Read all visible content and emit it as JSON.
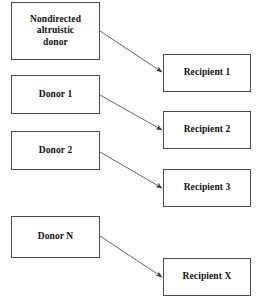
{
  "diagram": {
    "type": "flow-diagram",
    "canvas": {
      "width": 262,
      "height": 307,
      "background": "#fdfdfd"
    },
    "style": {
      "box_fill": "#ffffff",
      "box_border": "#4a4a4a",
      "text_color": "#101010",
      "arrow_color": "#555555"
    },
    "donors": [
      {
        "id": "nondirected-altruistic-donor",
        "label": "Nondirected\naltruistic\ndonor",
        "x": 11,
        "y": 2,
        "w": 89,
        "h": 58
      },
      {
        "id": "donor-1",
        "label": "Donor 1",
        "x": 11,
        "y": 75,
        "w": 89,
        "h": 39
      },
      {
        "id": "donor-2",
        "label": "Donor 2",
        "x": 11,
        "y": 131,
        "w": 89,
        "h": 39
      },
      {
        "id": "donor-n",
        "label": "Donor N",
        "x": 11,
        "y": 216,
        "w": 89,
        "h": 42
      }
    ],
    "recipients": [
      {
        "id": "recipient-1",
        "label": "Recipient 1",
        "x": 163,
        "y": 54,
        "w": 88,
        "h": 38
      },
      {
        "id": "recipient-2",
        "label": "Recipient 2",
        "x": 163,
        "y": 111,
        "w": 88,
        "h": 38
      },
      {
        "id": "recipient-3",
        "label": "Recipient 3",
        "x": 163,
        "y": 169,
        "w": 88,
        "h": 38
      },
      {
        "id": "recipient-x",
        "label": "Recipient X",
        "x": 163,
        "y": 258,
        "w": 88,
        "h": 38
      }
    ],
    "arrows": [
      {
        "id": "arrow-altruistic-to-recipient-1",
        "from": "nondirected-altruistic-donor",
        "to": "recipient-1",
        "x1": 100,
        "y1": 31,
        "x2": 162,
        "y2": 72
      },
      {
        "id": "arrow-donor-1-to-recipient-2",
        "from": "donor-1",
        "to": "recipient-2",
        "x1": 100,
        "y1": 95,
        "x2": 162,
        "y2": 130
      },
      {
        "id": "arrow-donor-2-to-recipient-3",
        "from": "donor-2",
        "to": "recipient-3",
        "x1": 100,
        "y1": 152,
        "x2": 162,
        "y2": 188
      },
      {
        "id": "arrow-donor-n-to-recipient-x",
        "from": "donor-n",
        "to": "recipient-x",
        "x1": 100,
        "y1": 236,
        "x2": 162,
        "y2": 277
      }
    ]
  }
}
